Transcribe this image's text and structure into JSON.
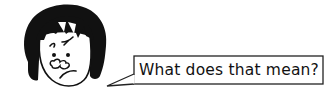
{
  "scene": {
    "character": {
      "description": "cartoon woman with black bob haircut, furrowed brow, puzzled expression",
      "hair_color": "#111111",
      "skin_color": "#ffffff",
      "line_color": "#111111"
    },
    "speech_bubble": {
      "text": "What does that mean?",
      "border_color": "#222222",
      "fill_color": "#ffffff"
    }
  },
  "icons": {
    "face": "person-face-icon",
    "bubble": "speech-bubble-icon"
  }
}
